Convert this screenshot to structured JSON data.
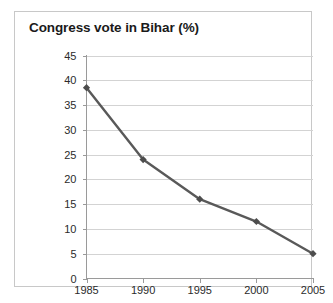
{
  "chart_data": {
    "type": "line",
    "title": "Congress vote in Bihar (%)",
    "xlabel": "",
    "ylabel": "",
    "x": [
      1985,
      1990,
      1995,
      2000,
      2005
    ],
    "categories": [
      "1985",
      "1990",
      "1995",
      "2000",
      "2005"
    ],
    "values": [
      38.5,
      24,
      16,
      11.5,
      5
    ],
    "series": [
      {
        "name": "Congress vote in Bihar (%)",
        "values": [
          38.5,
          24,
          16,
          11.5,
          5
        ]
      }
    ],
    "ylim": [
      0,
      45
    ],
    "ytick_values": [
      0,
      5,
      10,
      15,
      20,
      25,
      30,
      35,
      40,
      45
    ],
    "ytick_labels": [
      "0",
      "5",
      "10",
      "15",
      "20",
      "25",
      "30",
      "35",
      "40",
      "45"
    ],
    "xtick_labels": [
      "1985",
      "1990",
      "1995",
      "2000",
      "2005"
    ],
    "grid": "horizontal",
    "legend": "none",
    "marker": "diamond",
    "line_color": "#595959",
    "marker_color": "#4d4d4d",
    "grid_color": "#d3d3d3",
    "axis_color": "#9a9a9a",
    "plot_background": "#ffffff",
    "frame_border_color": "#c8c8c8",
    "title_color": "#1a1a1a"
  }
}
